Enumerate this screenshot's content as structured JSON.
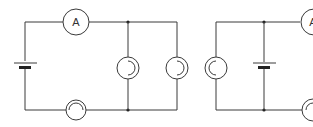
{
  "diagram": {
    "type": "circuit-schematic",
    "stroke_color": "#3a3a3a",
    "circuits": [
      {
        "id": "left-circuit",
        "components": [
          {
            "kind": "battery",
            "position": "left-vertical"
          },
          {
            "kind": "ammeter",
            "label": "A",
            "position": "top-wire"
          },
          {
            "kind": "lamp",
            "position": "bottom-wire"
          },
          {
            "kind": "lamp",
            "position": "parallel-branch-1"
          },
          {
            "kind": "lamp",
            "position": "parallel-branch-2"
          }
        ],
        "junctions": 2
      },
      {
        "id": "right-circuit",
        "components": [
          {
            "kind": "lamp",
            "position": "left-vertical"
          },
          {
            "kind": "battery",
            "position": "middle-branch"
          },
          {
            "kind": "ammeter",
            "label": "A",
            "position": "top-wire-right"
          },
          {
            "kind": "lamp",
            "position": "bottom-wire-right"
          }
        ],
        "junctions": 2
      }
    ],
    "ammeter_label_left": "A",
    "ammeter_label_right": "A"
  }
}
